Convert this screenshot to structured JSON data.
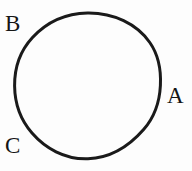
{
  "figure": {
    "background_color": "#fdfdfd",
    "stroke_color": "#1a1a1a",
    "label_color": "#151515",
    "canvas": {
      "width": 192,
      "height": 171
    },
    "shape": {
      "type": "circle",
      "center_x": 87.5,
      "center_y": 86,
      "radius": 73,
      "stroke_width": 3
    },
    "labels": [
      {
        "id": "A",
        "text": "A",
        "x": 167,
        "y": 84,
        "position": "right"
      },
      {
        "id": "B",
        "text": "B",
        "x": 5,
        "y": 12,
        "position": "top-left"
      },
      {
        "id": "C",
        "text": "C",
        "x": 5,
        "y": 134,
        "position": "bottom-left"
      }
    ]
  }
}
